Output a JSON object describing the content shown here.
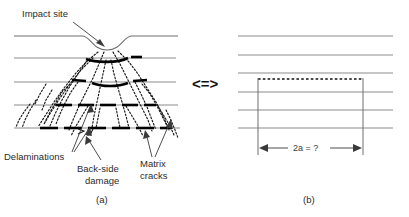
{
  "figure": {
    "background_color": "#ffffff",
    "ply_line_color": "#8c8c8c",
    "delamination_color": "#000000",
    "crack_color": "#1a1a1a",
    "text_color": "#2b2b2b"
  },
  "panel_a": {
    "caption": "(a)",
    "labels": {
      "impact_site": "Impact site",
      "delaminations": "Delaminations",
      "back_side_damage": "Back-side\ndamage",
      "back_side_damage_line1": "Back-side",
      "back_side_damage_line2": "damage",
      "matrix_cracks_line1": "Matrix",
      "matrix_cracks_line2": "cracks"
    },
    "ply_interface_y": [
      36,
      58,
      82,
      105,
      128
    ],
    "ply_count": 5,
    "impact_dent": {
      "center_x": 107,
      "left_x": 82,
      "right_x": 130,
      "depth": 14
    }
  },
  "equivalence": {
    "symbol": "<=>"
  },
  "panel_b": {
    "caption": "(b)",
    "dimension_label": "2a = ?",
    "ply_interface_y": [
      36,
      55,
      73,
      92,
      110,
      128
    ],
    "ply_count": 6,
    "delamination_left_x": 258,
    "delamination_right_x": 363,
    "delamination_y": 79,
    "dimension_arrow_y": 148
  }
}
